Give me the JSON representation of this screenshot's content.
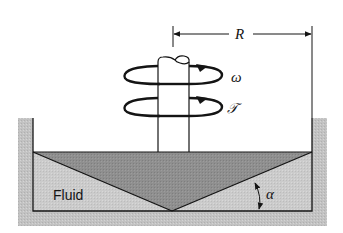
{
  "figure": {
    "type": "cone-and-plate viscometer schematic",
    "labels": {
      "radius": "R",
      "angular_velocity": "ω",
      "torque": "𝒯",
      "fluid": "Fluid",
      "cone_angle": "α"
    }
  },
  "colors": {
    "background": "#ffffff",
    "container_wall": "#c4c4c4",
    "fluid": "#c9c9c9",
    "cone": "#8f8f8f",
    "line": "#141414"
  }
}
